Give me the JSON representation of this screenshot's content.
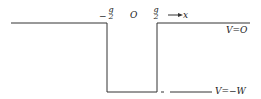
{
  "diagram": {
    "type": "potential-well",
    "labels": {
      "left_edge_num": "g",
      "left_edge_sign": "−",
      "left_edge_den": "2",
      "origin": "O",
      "right_edge_num": "g",
      "right_edge_den": "2",
      "axis": "→x",
      "top_level": "V=O",
      "bottom_level": "V=−W"
    },
    "colors": {
      "line": "#333333",
      "background": "#ffffff"
    }
  }
}
